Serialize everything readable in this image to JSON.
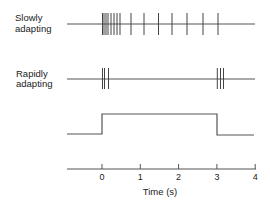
{
  "labels": {
    "slow_line1": "Slowly",
    "slow_line2": "adapting",
    "rapid_line1": "Rapidly",
    "rapid_line2": "adapting",
    "xaxis_title": "Time (s)"
  },
  "axis": {
    "ticks": [
      "0",
      "1",
      "2",
      "3",
      "4"
    ],
    "tick_values": [
      0,
      1,
      2,
      3,
      4
    ],
    "x0_px": 102,
    "px_per_s": 38.3,
    "line_start_px": 67,
    "line_end_px": 256,
    "y_px": 169
  },
  "traces": {
    "slow": {
      "y_px": 24,
      "spike_top": 13,
      "spike_bottom": 35,
      "spike_x_px": [
        102.5,
        104,
        106,
        108,
        111,
        114,
        117,
        120,
        131,
        144,
        158.5,
        172,
        187,
        203,
        218
      ]
    },
    "rapid": {
      "y_px": 79,
      "spike_top": 68,
      "spike_bottom": 89,
      "spike_x_px": [
        102.5,
        104.5,
        108.5,
        217.3,
        220.5,
        223.5
      ]
    },
    "stimulus": {
      "low_y_px": 134,
      "high_y_px": 114,
      "start_px": 67,
      "on_px": 102,
      "off_px": 217,
      "end_px": 254
    }
  },
  "colors": {
    "line": "#555555",
    "spike": "#444444",
    "text": "#222222"
  }
}
